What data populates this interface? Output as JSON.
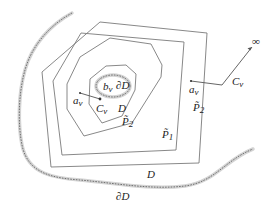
{
  "diagram": {
    "labels": {
      "infinity": "∞",
      "a_v_outer": "a",
      "a_v_outer_sub": "ν",
      "c_v_outer": "C",
      "c_v_outer_sub": "ν",
      "p2_outer": "P̃",
      "p2_outer_sub": "2",
      "p1": "P̃",
      "p1_sub": "1",
      "b_v": "b",
      "b_v_sub": "ν",
      "dD_inner": "∂D",
      "a_v_inner": "a",
      "a_v_inner_sub": "ν",
      "c_v_inner": "C",
      "c_v_inner_sub": "ν",
      "D_inner": "D",
      "p2_inner": "P̃",
      "p2_inner_sub": "2",
      "D_outer": "D",
      "dD_outer": "∂D"
    },
    "colors": {
      "polygon_stroke": "#7a7a7a",
      "boundary_halo": "#d4d4d4",
      "boundary_dash": "#555555",
      "text": "#222222"
    }
  }
}
